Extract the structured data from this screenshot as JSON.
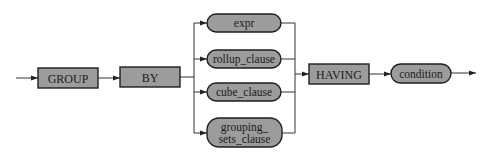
{
  "diagram": {
    "type": "syntax-railroad",
    "colors": {
      "node_fill": "#9c9c9c",
      "node_stroke": "#1e1e1e",
      "line": "#333333",
      "background": "#ffffff"
    },
    "keywords": [
      {
        "id": "group",
        "label": "GROUP",
        "shape": "rectangle"
      },
      {
        "id": "by",
        "label": "BY",
        "shape": "rectangle"
      },
      {
        "id": "having",
        "label": "HAVING",
        "shape": "rectangle"
      }
    ],
    "branch_options": [
      {
        "id": "expr",
        "label": "expr",
        "shape": "rounded"
      },
      {
        "id": "rollup_clause",
        "label": "rollup_clause",
        "shape": "rounded"
      },
      {
        "id": "cube_clause",
        "label": "cube_clause",
        "shape": "rounded"
      },
      {
        "id": "grouping_sets_clause",
        "line1": "grouping_",
        "line2": "sets_clause",
        "shape": "rounded"
      }
    ],
    "terminal": {
      "id": "condition",
      "label": "condition",
      "shape": "rounded"
    }
  }
}
